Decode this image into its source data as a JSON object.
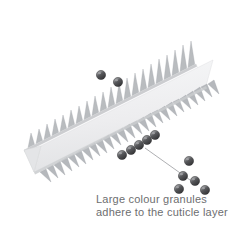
{
  "figure": {
    "background_color": "#ffffff"
  },
  "caption": {
    "line1": "Large colour granules",
    "line2": "adhere to the cuticle layer",
    "color": "#6d6e70",
    "font_size_px": 11
  },
  "cuticle": {
    "label": "cuticle-layer-slab",
    "face_color_light": "#fdfdfd",
    "face_color_shadow": "#e9eaec",
    "edge_color": "#9a9da1",
    "scale_color": "#b7babd",
    "scale_count_top": 22,
    "scale_count_front": 26
  },
  "granules": {
    "label": "colour-granules",
    "fill_color": "#4a4a4c",
    "highlight_color": "#8e8f92",
    "outline_color": "#2e2e30",
    "radius_px": 4.6,
    "on_cuticle_upper": [
      {
        "cx": 101,
        "cy": 75
      },
      {
        "cx": 118,
        "cy": 82
      }
    ],
    "on_cuticle_lower": [
      {
        "cx": 122,
        "cy": 155
      },
      {
        "cx": 131,
        "cy": 150
      },
      {
        "cx": 139,
        "cy": 145
      },
      {
        "cx": 147,
        "cy": 140
      },
      {
        "cx": 155,
        "cy": 135
      }
    ],
    "free_cluster": [
      {
        "cx": 189,
        "cy": 161
      },
      {
        "cx": 183,
        "cy": 176
      },
      {
        "cx": 195,
        "cy": 181
      },
      {
        "cx": 179,
        "cy": 189
      },
      {
        "cx": 205,
        "cy": 190
      }
    ]
  },
  "leader_line": {
    "label": "leader-line",
    "color": "#8b8d90",
    "x1": 145,
    "y1": 148,
    "x2": 190,
    "y2": 180
  }
}
